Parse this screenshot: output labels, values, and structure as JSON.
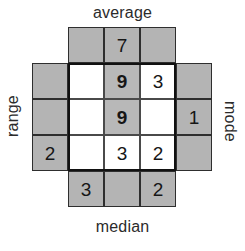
{
  "figure": {
    "type": "cross-shaped-number-grid",
    "labels": {
      "top": "average",
      "bottom": "median",
      "left": "range",
      "right": "mode"
    },
    "colors": {
      "arm_fill": "#b4b4b4",
      "inner_fill": "#ffffff",
      "inner_shaded_fill": "#b8b8b8",
      "grid_line": "#2e2e2e",
      "inner_outline": "#111111",
      "text": "#161616",
      "background": "#ffffff"
    },
    "arms": {
      "top": {
        "label_ref": "average",
        "cells": [
          "",
          "7",
          ""
        ]
      },
      "left": {
        "label_ref": "range",
        "cells": [
          "",
          "",
          "2"
        ]
      },
      "right": {
        "label_ref": "mode",
        "cells": [
          "",
          "1",
          ""
        ]
      },
      "bottom": {
        "label_ref": "median",
        "cells": [
          "3",
          "",
          "2"
        ]
      }
    },
    "inner_grid": {
      "rows": 3,
      "cols": 3,
      "cells": [
        [
          {
            "value": "",
            "shaded": false,
            "bold": false
          },
          {
            "value": "9",
            "shaded": true,
            "bold": true
          },
          {
            "value": "3",
            "shaded": false,
            "bold": false
          }
        ],
        [
          {
            "value": "",
            "shaded": false,
            "bold": false
          },
          {
            "value": "9",
            "shaded": true,
            "bold": true
          },
          {
            "value": "",
            "shaded": false,
            "bold": false
          }
        ],
        [
          {
            "value": "",
            "shaded": false,
            "bold": false
          },
          {
            "value": "3",
            "shaded": false,
            "bold": false
          },
          {
            "value": "2",
            "shaded": false,
            "bold": false
          }
        ]
      ]
    }
  }
}
